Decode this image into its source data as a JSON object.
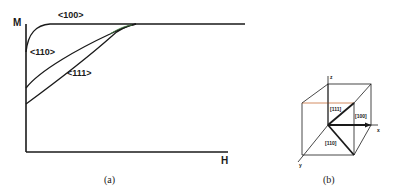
{
  "panel_a": {
    "caption": "(a)",
    "y_axis_label": "M",
    "x_axis_label": "H",
    "curves": [
      {
        "name": "<100>",
        "label": "<100>"
      },
      {
        "name": "<110>",
        "label": "<110>"
      },
      {
        "name": "<111>",
        "label": "<111>"
      }
    ]
  },
  "panel_b": {
    "caption": "(b)",
    "axes": {
      "x": "x",
      "y": "y",
      "z": "z"
    },
    "directions": {
      "d111": "[111]",
      "d100": "[100]",
      "d110": "[110]"
    }
  },
  "colors": {
    "ink": "#1a1a1a",
    "accent_edge": "#c8703a",
    "curve_tint": "#4a8a4a"
  }
}
